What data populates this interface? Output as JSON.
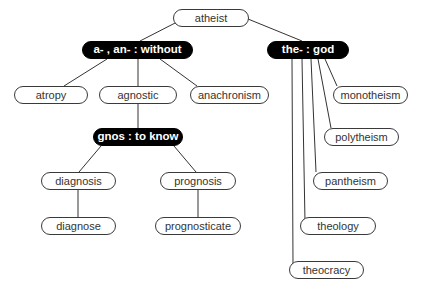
{
  "diagram": {
    "type": "tree",
    "colors": {
      "dark_node_fill": "#000000",
      "dark_node_text": "#ffffff",
      "light_node_fill": "#ffffff",
      "light_node_border": "#3a3a3a",
      "edge": "#333333"
    },
    "nodes": {
      "atheist": {
        "label": "atheist",
        "style": "light",
        "x": 173,
        "y": 9,
        "w": 76,
        "h": 18
      },
      "a_an_without": {
        "label": "a- , an- : without",
        "style": "dark",
        "x": 82,
        "y": 41,
        "w": 111,
        "h": 18
      },
      "the_god": {
        "label": "the- : god",
        "style": "dark",
        "x": 267,
        "y": 41,
        "w": 82,
        "h": 18
      },
      "atropy": {
        "label": "atropy",
        "style": "light",
        "x": 14,
        "y": 86,
        "w": 74,
        "h": 18
      },
      "agnostic": {
        "label": "agnostic",
        "style": "light",
        "x": 99,
        "y": 86,
        "w": 78,
        "h": 18
      },
      "anachronism": {
        "label": "anachronism",
        "style": "light",
        "x": 190,
        "y": 86,
        "w": 79,
        "h": 18
      },
      "gnos_to_know": {
        "label": "gnos : to know",
        "style": "dark",
        "x": 93,
        "y": 128,
        "w": 90,
        "h": 18
      },
      "diagnosis": {
        "label": "diagnosis",
        "style": "light",
        "x": 41,
        "y": 172,
        "w": 75,
        "h": 18
      },
      "prognosis": {
        "label": "prognosis",
        "style": "light",
        "x": 160,
        "y": 172,
        "w": 76,
        "h": 18
      },
      "diagnose": {
        "label": "diagnose",
        "style": "light",
        "x": 41,
        "y": 217,
        "w": 75,
        "h": 18
      },
      "prognosticate": {
        "label": "prognosticate",
        "style": "light",
        "x": 155,
        "y": 217,
        "w": 86,
        "h": 18
      },
      "monotheism": {
        "label": "monotheism",
        "style": "light",
        "x": 333,
        "y": 86,
        "w": 75,
        "h": 18
      },
      "polytheism": {
        "label": "polytheism",
        "style": "light",
        "x": 324,
        "y": 128,
        "w": 75,
        "h": 18
      },
      "pantheism": {
        "label": "pantheism",
        "style": "light",
        "x": 313,
        "y": 172,
        "w": 75,
        "h": 18
      },
      "theology": {
        "label": "theology",
        "style": "light",
        "x": 300,
        "y": 217,
        "w": 76,
        "h": 18
      },
      "theocracy": {
        "label": "theocracy",
        "style": "light",
        "x": 289,
        "y": 261,
        "w": 75,
        "h": 18
      }
    },
    "edges": [
      {
        "from": "atheist",
        "to": "a_an_without",
        "points": [
          [
            179,
            21
          ],
          [
            140,
            41
          ]
        ]
      },
      {
        "from": "atheist",
        "to": "the_god",
        "points": [
          [
            248,
            19
          ],
          [
            302,
            41
          ]
        ]
      },
      {
        "from": "a_an_without",
        "to": "atropy",
        "points": [
          [
            107,
            59
          ],
          [
            64,
            86
          ]
        ]
      },
      {
        "from": "a_an_without",
        "to": "agnostic",
        "points": [
          [
            138,
            59
          ],
          [
            138,
            86
          ]
        ]
      },
      {
        "from": "a_an_without",
        "to": "anachronism",
        "points": [
          [
            160,
            59
          ],
          [
            197,
            86
          ]
        ]
      },
      {
        "from": "agnostic",
        "to": "gnos_to_know",
        "points": [
          [
            138,
            104
          ],
          [
            138,
            128
          ]
        ]
      },
      {
        "from": "gnos_to_know",
        "to": "diagnosis",
        "points": [
          [
            101,
            146
          ],
          [
            79,
            172
          ]
        ]
      },
      {
        "from": "gnos_to_know",
        "to": "prognosis",
        "points": [
          [
            174,
            146
          ],
          [
            196,
            172
          ]
        ]
      },
      {
        "from": "diagnosis",
        "to": "diagnose",
        "points": [
          [
            78,
            190
          ],
          [
            78,
            217
          ]
        ]
      },
      {
        "from": "prognosis",
        "to": "prognosticate",
        "points": [
          [
            198,
            190
          ],
          [
            198,
            217
          ]
        ]
      },
      {
        "from": "the_god",
        "to": "monotheism",
        "points": [
          [
            325,
            59
          ],
          [
            337,
            86
          ]
        ]
      },
      {
        "from": "the_god",
        "to": "polytheism",
        "points": [
          [
            318,
            59
          ],
          [
            331,
            128
          ]
        ]
      },
      {
        "from": "the_god",
        "to": "pantheism",
        "points": [
          [
            311,
            59
          ],
          [
            316,
            172
          ]
        ]
      },
      {
        "from": "the_god",
        "to": "theology",
        "points": [
          [
            302,
            59
          ],
          [
            305,
            222
          ],
          [
            305,
            222
          ]
        ]
      },
      {
        "from": "the_god",
        "to": "theocracy",
        "points": [
          [
            292,
            59
          ],
          [
            293,
            266
          ]
        ]
      }
    ]
  }
}
